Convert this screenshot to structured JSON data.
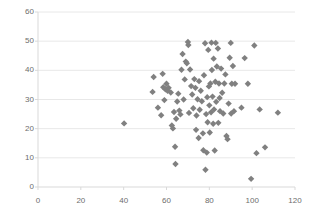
{
  "chart_data": {
    "type": "scatter",
    "title": "",
    "xlabel": "",
    "ylabel": "",
    "xlim": [
      0,
      120
    ],
    "ylim": [
      0,
      60
    ],
    "xticks": [
      0,
      20,
      40,
      60,
      80,
      100,
      120
    ],
    "yticks": [
      0,
      10,
      20,
      30,
      40,
      50,
      60
    ],
    "grid": "horizontal",
    "legend": "none",
    "marker": "diamond",
    "marker_color": "#808080",
    "marker_size": 4,
    "axis_color": "#d9d9d9",
    "grid_color": "#e8e8e8",
    "tick_label_color": "#6d6d6d",
    "series": [
      {
        "name": "Series 1",
        "points": [
          [
            40.2,
            21.8
          ],
          [
            53.5,
            32.6
          ],
          [
            54.0,
            37.7
          ],
          [
            56.0,
            27.2
          ],
          [
            57.5,
            24.6
          ],
          [
            58.2,
            38.8
          ],
          [
            58.5,
            34.2
          ],
          [
            59.0,
            29.8
          ],
          [
            59.5,
            33.5
          ],
          [
            60.0,
            35.4
          ],
          [
            60.5,
            33.0
          ],
          [
            61.0,
            34.0
          ],
          [
            62.0,
            32.4
          ],
          [
            62.5,
            21.1
          ],
          [
            63.0,
            20.1
          ],
          [
            63.5,
            25.7
          ],
          [
            64.0,
            13.8
          ],
          [
            64.2,
            7.9
          ],
          [
            64.5,
            23.4
          ],
          [
            65.0,
            29.3
          ],
          [
            65.5,
            32.0
          ],
          [
            66.0,
            26.2
          ],
          [
            66.5,
            24.9
          ],
          [
            67.0,
            40.2
          ],
          [
            67.5,
            45.6
          ],
          [
            68.0,
            30.0
          ],
          [
            68.5,
            36.9
          ],
          [
            69.0,
            43.0
          ],
          [
            69.5,
            42.4
          ],
          [
            70.0,
            49.7
          ],
          [
            70.2,
            48.7
          ],
          [
            70.5,
            25.4
          ],
          [
            71.0,
            40.3
          ],
          [
            71.5,
            34.6
          ],
          [
            72.0,
            31.7
          ],
          [
            72.5,
            27.0
          ],
          [
            73.0,
            37.0
          ],
          [
            73.5,
            34.0
          ],
          [
            73.8,
            19.6
          ],
          [
            74.0,
            24.5
          ],
          [
            74.5,
            30.1
          ],
          [
            75.0,
            16.8
          ],
          [
            75.2,
            36.3
          ],
          [
            75.5,
            26.5
          ],
          [
            76.0,
            33.0
          ],
          [
            76.5,
            29.4
          ],
          [
            77.0,
            18.4
          ],
          [
            77.2,
            12.6
          ],
          [
            77.5,
            38.3
          ],
          [
            78.0,
            49.3
          ],
          [
            78.2,
            5.9
          ],
          [
            78.5,
            25.0
          ],
          [
            78.8,
            11.8
          ],
          [
            79.0,
            30.8
          ],
          [
            79.2,
            22.2
          ],
          [
            79.5,
            47.0
          ],
          [
            79.8,
            34.5
          ],
          [
            80.0,
            28.0
          ],
          [
            80.2,
            18.7
          ],
          [
            80.5,
            35.5
          ],
          [
            80.8,
            25.6
          ],
          [
            81.0,
            49.5
          ],
          [
            81.2,
            40.1
          ],
          [
            81.5,
            31.0
          ],
          [
            81.8,
            21.7
          ],
          [
            82.0,
            44.0
          ],
          [
            82.2,
            26.6
          ],
          [
            82.5,
            12.5
          ],
          [
            82.8,
            36.1
          ],
          [
            83.0,
            49.4
          ],
          [
            83.2,
            29.2
          ],
          [
            83.5,
            41.3
          ],
          [
            84.0,
            47.5
          ],
          [
            84.2,
            22.0
          ],
          [
            84.5,
            35.5
          ],
          [
            84.8,
            30.5
          ],
          [
            85.0,
            26.0
          ],
          [
            85.5,
            40.6
          ],
          [
            86.0,
            32.3
          ],
          [
            86.5,
            25.2
          ],
          [
            87.0,
            35.5
          ],
          [
            87.5,
            38.6
          ],
          [
            88.0,
            17.5
          ],
          [
            88.5,
            16.4
          ],
          [
            89.0,
            28.6
          ],
          [
            89.5,
            44.3
          ],
          [
            90.0,
            49.4
          ],
          [
            90.2,
            25.2
          ],
          [
            90.5,
            35.4
          ],
          [
            91.0,
            41.5
          ],
          [
            91.5,
            26.0
          ],
          [
            92.0,
            35.4
          ],
          [
            95.0,
            27.2
          ],
          [
            96.5,
            44.2
          ],
          [
            98.0,
            35.4
          ],
          [
            99.5,
            2.8
          ],
          [
            101.0,
            48.5
          ],
          [
            102.0,
            11.6
          ],
          [
            103.5,
            26.6
          ],
          [
            106.0,
            13.6
          ],
          [
            112.0,
            25.5
          ]
        ]
      }
    ]
  },
  "axes": {
    "y_tick_labels": [
      "0",
      "10",
      "20",
      "30",
      "40",
      "50",
      "60"
    ],
    "x_tick_labels": [
      "0",
      "20",
      "40",
      "60",
      "80",
      "100",
      "120"
    ]
  }
}
